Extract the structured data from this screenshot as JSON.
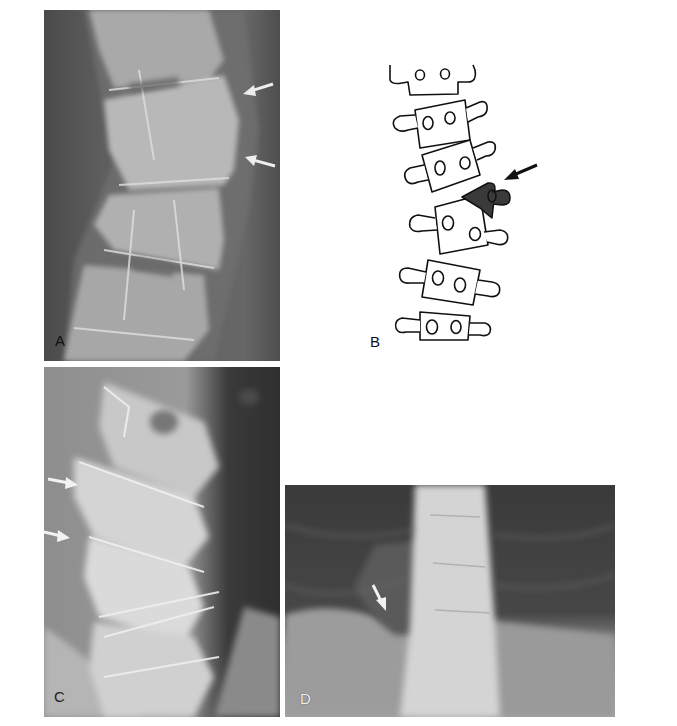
{
  "figure": {
    "layout": "2x2 radiograph composite",
    "panels": [
      {
        "id": "A",
        "label": "A",
        "type": "lateral spine radiograph",
        "arrows": [
          {
            "color": "white",
            "direction": "pointing left-down"
          },
          {
            "color": "white",
            "direction": "pointing left-up"
          }
        ]
      },
      {
        "id": "B",
        "label": "B",
        "type": "line drawing of lateral vertebral column",
        "vertebrae_count": 7,
        "highlighted_vertebra": {
          "fill": "#3a3a3a",
          "shape": "wedge / fractured"
        },
        "arrows": [
          {
            "color": "black",
            "direction": "pointing left-down"
          }
        ]
      },
      {
        "id": "C",
        "label": "C",
        "type": "lateral spine radiograph",
        "arrows": [
          {
            "color": "white",
            "direction": "pointing right"
          },
          {
            "color": "white",
            "direction": "pointing right"
          }
        ]
      },
      {
        "id": "D",
        "label": "D",
        "type": "frontal thoracolumbar radiograph",
        "arrows": [
          {
            "color": "white",
            "direction": "pointing down-right"
          }
        ]
      }
    ]
  },
  "labels": {
    "a": "A",
    "b": "B",
    "c": "C",
    "d": "D"
  },
  "colors": {
    "page_background": "#ffffff",
    "xray_dark": "#3c3c3c",
    "xray_bone": "#d8d8d8",
    "drawing_line": "#111111",
    "fracture_fill": "#3a3a3a"
  }
}
